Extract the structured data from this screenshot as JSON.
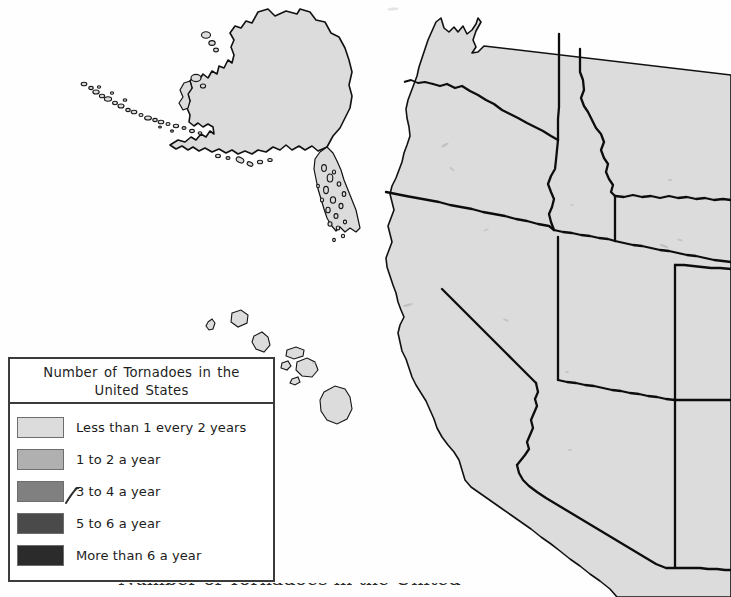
{
  "page": {
    "background_color": "#fefefe",
    "width": 731,
    "height": 597
  },
  "map": {
    "title": "Number of Tornadoes in the United States",
    "projection_note": "western United States with Alaska and Hawaii insets",
    "state_fill_color": "#dcdcdc",
    "state_border_color": "#111111",
    "regions": [
      {
        "name": "alaska",
        "shade": "#dcdcdc",
        "category": "Less than 1 every 2 years"
      },
      {
        "name": "hawaii",
        "shade": "#dcdcdc",
        "category": "Less than 1 every 2 years"
      },
      {
        "name": "washington",
        "shade": "#dcdcdc",
        "category": "Less than 1 every 2 years"
      },
      {
        "name": "oregon",
        "shade": "#dcdcdc",
        "category": "Less than 1 every 2 years"
      },
      {
        "name": "idaho",
        "shade": "#dcdcdc",
        "category": "Less than 1 every 2 years"
      },
      {
        "name": "montana",
        "shade": "#dcdcdc",
        "category": "Less than 1 every 2 years"
      },
      {
        "name": "wyoming",
        "shade": "#dcdcdc",
        "category": "Less than 1 every 2 years"
      },
      {
        "name": "california",
        "shade": "#dcdcdc",
        "category": "Less than 1 every 2 years"
      },
      {
        "name": "nevada",
        "shade": "#dcdcdc",
        "category": "Less than 1 every 2 years"
      },
      {
        "name": "utah",
        "shade": "#dcdcdc",
        "category": "Less than 1 every 2 years"
      },
      {
        "name": "arizona",
        "shade": "#dcdcdc",
        "category": "Less than 1 every 2 years"
      },
      {
        "name": "colorado",
        "shade": "#dcdcdc",
        "category": "Less than 1 every 2 years"
      },
      {
        "name": "new-mexico",
        "shade": "#dcdcdc",
        "category": "Less than 1 every 2 years"
      }
    ]
  },
  "legend": {
    "title": "Number of Tornadoes in the United States",
    "items": [
      {
        "label": "Less than 1 every 2 years",
        "color": "#dcdcdc"
      },
      {
        "label": "1 to 2 a year",
        "color": "#b0b0b0"
      },
      {
        "label": "3 to 4 a year",
        "color": "#808080"
      },
      {
        "label": "5 to 6 a year",
        "color": "#4a4a4a"
      },
      {
        "label": "More than 6 a year",
        "color": "#2b2b2b"
      }
    ]
  },
  "annotations": {
    "pen_mark_note": "handwritten check mark over the 3"
  },
  "bottom_caption": {
    "text": "Number of Tornadoes in the United"
  }
}
